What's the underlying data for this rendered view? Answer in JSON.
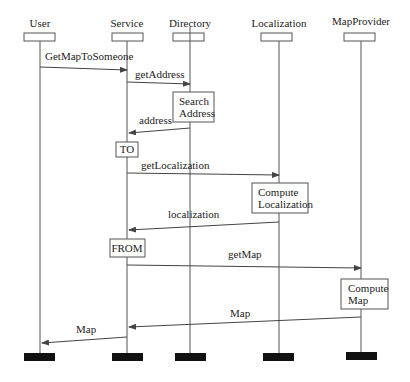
{
  "diagram": {
    "type": "sequence-diagram",
    "lifelines": [
      {
        "id": "user",
        "label": "User",
        "x": 40
      },
      {
        "id": "service",
        "label": "Service",
        "x": 127
      },
      {
        "id": "directory",
        "label": "Directory",
        "x": 190
      },
      {
        "id": "localization",
        "label": "Localization",
        "x": 279
      },
      {
        "id": "mapprovider",
        "label": "MapProvider",
        "x": 361
      }
    ],
    "messages": [
      {
        "label": "GetMapToSomeone",
        "from": "user",
        "to": "service"
      },
      {
        "label": "getAddress",
        "from": "service",
        "to": "directory"
      },
      {
        "label": "address",
        "from": "directory",
        "to": "service"
      },
      {
        "label": "getLocalization",
        "from": "service",
        "to": "localization"
      },
      {
        "label": "localization",
        "from": "localization",
        "to": "service"
      },
      {
        "label": "getMap",
        "from": "service",
        "to": "mapprovider"
      },
      {
        "label": "Map",
        "from": "mapprovider",
        "to": "service"
      },
      {
        "label": "Map",
        "from": "service",
        "to": "user"
      }
    ],
    "activities": [
      {
        "lifeline": "directory",
        "lines": [
          "Search",
          "Address"
        ]
      },
      {
        "lifeline": "service",
        "lines": [
          "TO"
        ]
      },
      {
        "lifeline": "localization",
        "lines": [
          "Compute",
          "Localization"
        ]
      },
      {
        "lifeline": "service",
        "lines": [
          "FROM"
        ]
      },
      {
        "lifeline": "mapprovider",
        "lines": [
          "Compute",
          "Map"
        ]
      }
    ],
    "colors": {
      "line": "#555555",
      "text": "#222222",
      "terminator": "#111111",
      "background": "#ffffff"
    }
  }
}
